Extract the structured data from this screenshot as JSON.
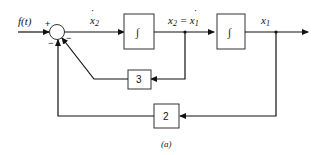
{
  "diagram": {
    "input_label": "f(t)",
    "summing_junction": {
      "signs": [
        "+",
        "−",
        "−"
      ]
    },
    "signals": {
      "x2dot": {
        "base": "x",
        "sub": "2",
        "dot": "˙"
      },
      "x2_eq": {
        "base": "x",
        "sub": "2",
        "eq": " = ",
        "rhs_base": "x",
        "rhs_sub": "1",
        "dot": "˙"
      },
      "x1": {
        "base": "x",
        "sub": "1"
      }
    },
    "blocks": {
      "integrator1": "∫",
      "integrator2": "∫",
      "gain_inner": "3",
      "gain_outer": "2"
    },
    "caption": "(a)"
  }
}
